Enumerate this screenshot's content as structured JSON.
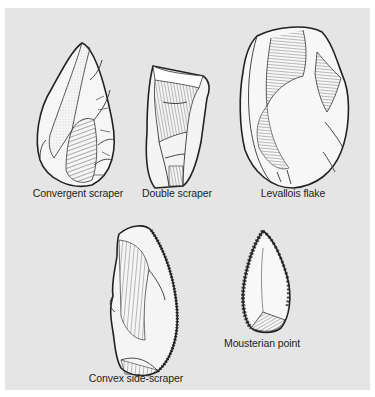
{
  "figure": {
    "background_color": "#e5e5e5",
    "ink_color": "#1f1f1f",
    "artifacts": [
      {
        "id": "convergent-scraper",
        "label": "Convergent scraper"
      },
      {
        "id": "double-scraper",
        "label": "Double scraper"
      },
      {
        "id": "levallois-flake",
        "label": "Levallois flake"
      },
      {
        "id": "convex-side-scraper",
        "label": "Convex side-scraper"
      },
      {
        "id": "mousterian-point",
        "label": "Mousterian point"
      }
    ]
  }
}
